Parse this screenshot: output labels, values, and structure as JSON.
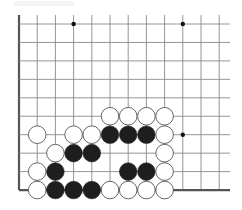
{
  "board": {
    "columns": 12,
    "rows": 10,
    "origin": {
      "x": 19,
      "y": 24
    },
    "spacing": {
      "x": 18.2,
      "y": 18.45
    },
    "line_top_extension": 9,
    "line_right_end": 230,
    "edges": [
      "left",
      "bottom"
    ],
    "colors": {
      "background": "#ffffff",
      "line": "#8a8a8a",
      "edge": "#555555",
      "black_stone": "#1e1e1e",
      "white_stone": "#ffffff",
      "white_stone_border": "#555555",
      "star_point": "#111111"
    },
    "star_points": [
      {
        "col": 3,
        "row": 0
      },
      {
        "col": 9,
        "row": 0
      },
      {
        "col": 9,
        "row": 6
      }
    ],
    "stones": [
      {
        "color": "white",
        "col": 5,
        "row": 5
      },
      {
        "color": "white",
        "col": 6,
        "row": 5
      },
      {
        "color": "white",
        "col": 7,
        "row": 5
      },
      {
        "color": "white",
        "col": 8,
        "row": 5
      },
      {
        "color": "white",
        "col": 1,
        "row": 6
      },
      {
        "color": "white",
        "col": 3,
        "row": 6
      },
      {
        "color": "white",
        "col": 4,
        "row": 6
      },
      {
        "color": "black",
        "col": 5,
        "row": 6
      },
      {
        "color": "black",
        "col": 6,
        "row": 6
      },
      {
        "color": "black",
        "col": 7,
        "row": 6
      },
      {
        "color": "white",
        "col": 8,
        "row": 6
      },
      {
        "color": "white",
        "col": 2,
        "row": 7
      },
      {
        "color": "black",
        "col": 3,
        "row": 7
      },
      {
        "color": "black",
        "col": 4,
        "row": 7
      },
      {
        "color": "white",
        "col": 8,
        "row": 7
      },
      {
        "color": "white",
        "col": 1,
        "row": 8
      },
      {
        "color": "black",
        "col": 2,
        "row": 8
      },
      {
        "color": "black",
        "col": 6,
        "row": 8
      },
      {
        "color": "black",
        "col": 7,
        "row": 8
      },
      {
        "color": "white",
        "col": 8,
        "row": 8
      },
      {
        "color": "white",
        "col": 1,
        "row": 9
      },
      {
        "color": "black",
        "col": 2,
        "row": 9
      },
      {
        "color": "black",
        "col": 3,
        "row": 9
      },
      {
        "color": "black",
        "col": 4,
        "row": 9
      },
      {
        "color": "white",
        "col": 5,
        "row": 9
      },
      {
        "color": "white",
        "col": 6,
        "row": 9
      },
      {
        "color": "white",
        "col": 7,
        "row": 9
      },
      {
        "color": "white",
        "col": 8,
        "row": 9
      }
    ]
  }
}
